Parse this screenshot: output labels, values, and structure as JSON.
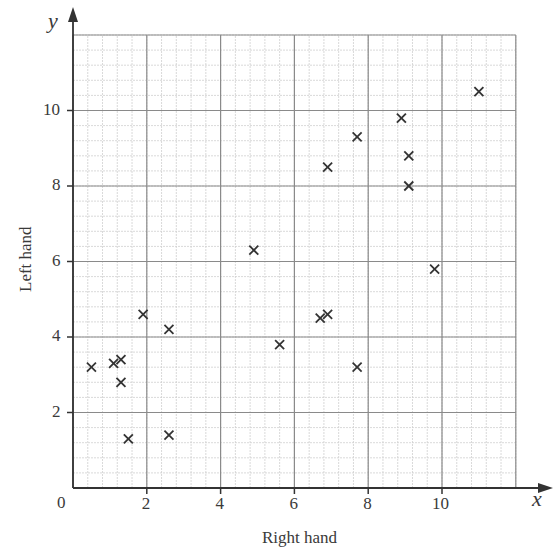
{
  "chart_data": {
    "type": "scatter",
    "title": "",
    "xlabel": "Right hand",
    "ylabel": "Left hand",
    "x_axis_letter": "x",
    "y_axis_letter": "y",
    "origin_label": "0",
    "xlim": [
      0,
      12
    ],
    "ylim": [
      0,
      12
    ],
    "x_ticks": [
      2,
      4,
      6,
      8,
      10
    ],
    "y_ticks": [
      2,
      4,
      6,
      8,
      10
    ],
    "grid": true,
    "marker": "x",
    "points": [
      {
        "x": 0.5,
        "y": 3.2
      },
      {
        "x": 1.1,
        "y": 3.3
      },
      {
        "x": 1.3,
        "y": 3.4
      },
      {
        "x": 1.3,
        "y": 2.8
      },
      {
        "x": 1.5,
        "y": 1.3
      },
      {
        "x": 1.9,
        "y": 4.6
      },
      {
        "x": 2.6,
        "y": 4.2
      },
      {
        "x": 2.6,
        "y": 1.4
      },
      {
        "x": 4.9,
        "y": 6.3
      },
      {
        "x": 5.6,
        "y": 3.8
      },
      {
        "x": 6.7,
        "y": 4.5
      },
      {
        "x": 6.9,
        "y": 4.6
      },
      {
        "x": 6.9,
        "y": 8.5
      },
      {
        "x": 7.7,
        "y": 9.3
      },
      {
        "x": 7.7,
        "y": 3.2
      },
      {
        "x": 8.9,
        "y": 9.8
      },
      {
        "x": 9.1,
        "y": 8.8
      },
      {
        "x": 9.1,
        "y": 8.0
      },
      {
        "x": 9.8,
        "y": 5.8
      },
      {
        "x": 11.0,
        "y": 10.5
      }
    ]
  },
  "colors": {
    "axis": "#333333",
    "major_grid": "#8a8a8a",
    "minor_grid": "#cfcfcf",
    "marker": "#333333"
  }
}
